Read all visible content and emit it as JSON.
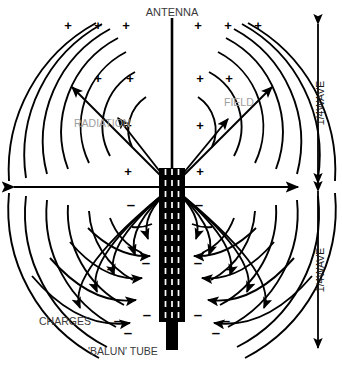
{
  "diagram": {
    "background": "#ffffff",
    "ink": "#000000",
    "ghost_ink": "#a9a9a9",
    "labels": {
      "antenna": "ANTENNA",
      "radiation": "RADIATION",
      "field": "FIELD",
      "charges": "CHARGES",
      "balun_tube": "'BALUN' TUBE",
      "quarter_wave_upper": "1/4WAVE",
      "quarter_wave_lower": "1/4WAVE"
    },
    "charge_symbols": {
      "positive": "+",
      "negative": "–",
      "positive_count": 14,
      "negative_count": 14,
      "positive_region": "upper half - above horizontal axis",
      "negative_region": "lower half - below horizontal axis"
    },
    "geometry": {
      "feedpoint_x": 172,
      "feedpoint_y": 187,
      "mast_top_y": 18,
      "tube_top_y": 168,
      "tube_bottom_y": 322,
      "stub_bottom_y": 350,
      "axis_left_x": 14,
      "axis_right_x": 298,
      "arc_count_per_side": 7,
      "arc_radii": [
        40,
        62,
        84,
        106,
        128,
        150,
        168
      ]
    },
    "dimension_arrows": {
      "upper": {
        "from_y": 22,
        "to_y": 185,
        "x": 318,
        "direction": "double"
      },
      "lower": {
        "from_y": 190,
        "to_y": 348,
        "x": 318,
        "direction": "double"
      }
    },
    "elements": {
      "vertical_mast": "antenna radiator - vertical line",
      "horizontal_axis": "ground plane / reference axis with arrowheads both ends",
      "balun_tube": "black sleeve with dashed white hatching, 3 columns",
      "feed_stub": "solid black coaxial stub below balun tube",
      "arcs": "concentric radiation wavefronts",
      "radial_arrows": "field direction arrows - outward above axis, inward below axis"
    }
  }
}
